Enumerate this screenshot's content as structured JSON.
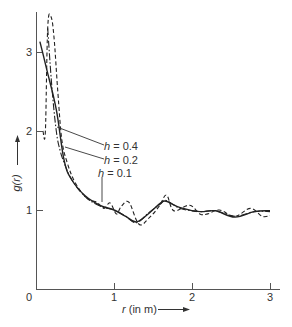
{
  "chart_data": {
    "type": "line",
    "title": "",
    "xlabel": "r (in m)",
    "ylabel": "g(r)",
    "xlim": [
      0,
      3.1
    ],
    "ylim": [
      0,
      3.6
    ],
    "xticks": [
      0,
      1,
      2,
      3
    ],
    "yticks": [
      1,
      2,
      3
    ],
    "xtick_labels": [
      "0",
      "1",
      "2",
      "3"
    ],
    "ytick_labels": [
      "1",
      "2",
      "3"
    ],
    "grid": false,
    "legend": "inline annotations with leader lines",
    "series": [
      {
        "name": "h = 0.4",
        "style": "solid",
        "x": [
          0.05,
          0.14,
          0.26,
          0.36,
          0.46,
          0.63,
          0.82,
          1.0,
          1.15,
          1.29,
          1.45,
          1.6,
          1.67,
          1.85,
          2.1,
          2.3,
          2.55,
          2.8,
          3.0
        ],
        "y": [
          3.13,
          2.77,
          2.27,
          1.63,
          1.38,
          1.18,
          1.06,
          1.0,
          0.92,
          0.85,
          0.96,
          1.09,
          1.11,
          1.03,
          0.98,
          0.99,
          0.91,
          0.98,
          0.99
        ]
      },
      {
        "name": "h = 0.2",
        "style": "dash-dot",
        "x": [
          0.15,
          0.2,
          0.26,
          0.31,
          0.36,
          0.46,
          0.63,
          0.82,
          1.0,
          1.15,
          1.29,
          1.45,
          1.6,
          1.67,
          1.85,
          2.1,
          2.3,
          2.55,
          2.8,
          3.0
        ],
        "y": [
          3.3,
          2.6,
          2.0,
          1.75,
          1.6,
          1.38,
          1.17,
          1.05,
          1.0,
          0.92,
          0.84,
          0.97,
          1.08,
          1.12,
          1.02,
          0.98,
          0.99,
          0.92,
          0.98,
          0.98
        ]
      },
      {
        "name": "h = 0.1",
        "style": "dashed",
        "x": [
          0.09,
          0.12,
          0.15,
          0.19,
          0.23,
          0.28,
          0.33,
          0.4,
          0.5,
          0.65,
          0.78,
          0.87,
          0.95,
          1.03,
          1.09,
          1.19,
          1.32,
          1.45,
          1.58,
          1.67,
          1.74,
          1.8,
          1.97,
          2.1,
          2.2,
          2.35,
          2.55,
          2.75,
          2.9,
          3.0
        ],
        "y": [
          2.0,
          2.0,
          3.3,
          3.45,
          3.2,
          2.5,
          1.9,
          1.6,
          1.35,
          1.15,
          1.1,
          1.02,
          1.09,
          0.95,
          1.04,
          1.1,
          0.82,
          0.9,
          1.05,
          1.19,
          1.02,
          0.99,
          1.06,
          0.95,
          0.95,
          1.0,
          0.92,
          1.02,
          0.92,
          0.93
        ]
      }
    ],
    "annotations": [
      {
        "text": "h = 0.4",
        "target_x": 0.24,
        "target_y": 2.05
      },
      {
        "text": "h = 0.2",
        "target_x": 0.31,
        "target_y": 1.75
      },
      {
        "text": "h = 0.1",
        "target_x": 0.83,
        "target_y": 1.1
      }
    ]
  },
  "axes": {
    "origin_label": "0",
    "x_label_var": "r",
    "x_label_unit": " (in m)",
    "y_label": "g(r)"
  },
  "labels": {
    "h04_var": "h",
    "h04_val": " = 0.4",
    "h02_var": "h",
    "h02_val": " = 0.2",
    "h01_var": "h",
    "h01_val": " = 0.1"
  }
}
